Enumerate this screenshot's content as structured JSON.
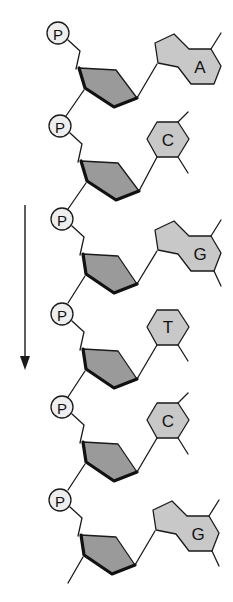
{
  "diagram": {
    "title": "",
    "colors": {
      "background": "#ffffff",
      "sugar_fill": "#9a9a9a",
      "base_fill": "#c8c8c8",
      "phosphate_fill": "#eeeeee",
      "stroke": "#1a1a1a"
    },
    "direction_arrow": {
      "label": "",
      "direction": "down"
    },
    "nucleotides": [
      {
        "phosphate_label": "P",
        "base_label": "A",
        "base_type": "purine"
      },
      {
        "phosphate_label": "P",
        "base_label": "C",
        "base_type": "pyrimidine"
      },
      {
        "phosphate_label": "P",
        "base_label": "G",
        "base_type": "purine"
      },
      {
        "phosphate_label": "P",
        "base_label": "T",
        "base_type": "pyrimidine"
      },
      {
        "phosphate_label": "P",
        "base_label": "C",
        "base_type": "pyrimidine"
      },
      {
        "phosphate_label": "P",
        "base_label": "G",
        "base_type": "purine"
      }
    ]
  }
}
